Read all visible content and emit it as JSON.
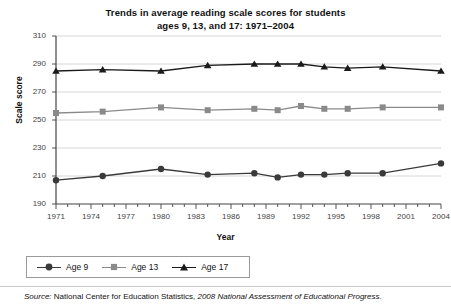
{
  "title": "Trends in average reading scale scores for students ages 9, 13, and 17: 1971–2004",
  "title_line1": "Trends in average reading scale scores for students",
  "title_line2": "ages 9, 13, and 17: 1971–2004",
  "source": {
    "prefix": "Source:",
    "agency": "National Center for Education Statistics,",
    "report": "2008 National Assessment of Educational Progress."
  },
  "legend": {
    "items": [
      {
        "label": "Age 9",
        "marker": "circle",
        "color": "#3a3a3a"
      },
      {
        "label": "Age 13",
        "marker": "square",
        "color": "#8a8a8a"
      },
      {
        "label": "Age 17",
        "marker": "triangle",
        "color": "#1a1a1a"
      }
    ]
  },
  "chart_data": {
    "type": "line",
    "title": "Trends in average reading scale scores for students ages 9, 13, and 17: 1971–2004",
    "xlabel": "Year",
    "ylabel": "Scale score",
    "xlim": [
      1971,
      2004
    ],
    "ylim": [
      190,
      310
    ],
    "yticks": [
      190,
      210,
      230,
      250,
      270,
      290,
      310
    ],
    "xticks": [
      1971,
      1974,
      1977,
      1980,
      1983,
      1986,
      1989,
      1992,
      1995,
      1998,
      2001,
      2004
    ],
    "x_minor_tick_interval": 1,
    "grid": "horizontal",
    "legend_position": "bottom-left",
    "series": [
      {
        "name": "Age 9",
        "marker": "circle",
        "color": "#3a3a3a",
        "x": [
          1971,
          1975,
          1980,
          1984,
          1988,
          1990,
          1992,
          1994,
          1996,
          1999,
          2004
        ],
        "values": [
          207,
          210,
          215,
          211,
          212,
          209,
          211,
          211,
          212,
          212,
          219
        ]
      },
      {
        "name": "Age 13",
        "marker": "square",
        "color": "#8a8a8a",
        "x": [
          1971,
          1975,
          1980,
          1984,
          1988,
          1990,
          1992,
          1994,
          1996,
          1999,
          2004
        ],
        "values": [
          255,
          256,
          259,
          257,
          258,
          257,
          260,
          258,
          258,
          259,
          259
        ]
      },
      {
        "name": "Age 17",
        "marker": "triangle",
        "color": "#1a1a1a",
        "x": [
          1971,
          1975,
          1980,
          1984,
          1988,
          1990,
          1992,
          1994,
          1996,
          1999,
          2004
        ],
        "values": [
          285,
          286,
          285,
          289,
          290,
          290,
          290,
          288,
          287,
          288,
          285
        ]
      }
    ]
  }
}
